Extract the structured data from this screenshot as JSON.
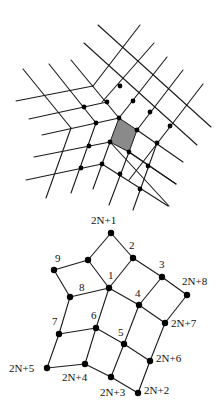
{
  "figure": {
    "top": {
      "title": "Lattice with a five-fold defect (quasi-square net around pentagonal vertex)",
      "shaded_cell_color": "#8a8a8a",
      "line_color": "#1a1a1a",
      "node_color": "#000000"
    },
    "bottom": {
      "labels": {
        "n2N1": "2N+1",
        "n2": "2",
        "n3": "3",
        "n2N8": "2N+8",
        "n9": "9",
        "n1": "1",
        "n8": "8",
        "n4": "4",
        "n7": "7",
        "n6": "6",
        "n2N7": "2N+7",
        "n5": "5",
        "n2N6": "2N+6",
        "n2N5": "2N+5",
        "n2N4": "2N+4",
        "n2N3": "2N+3",
        "n2N2": "2N+2"
      },
      "nodes": [
        {
          "id": "2N+1",
          "x": 111,
          "y": 233
        },
        {
          "id": "a",
          "x": 88,
          "y": 260
        },
        {
          "id": "2",
          "x": 133,
          "y": 258
        },
        {
          "id": "9",
          "x": 54,
          "y": 270
        },
        {
          "id": "3",
          "x": 162,
          "y": 277
        },
        {
          "id": "1",
          "x": 109,
          "y": 288
        },
        {
          "id": "2N+8",
          "x": 187,
          "y": 295
        },
        {
          "id": "8",
          "x": 70,
          "y": 297
        },
        {
          "id": "4",
          "x": 139,
          "y": 305
        },
        {
          "id": "7",
          "x": 59,
          "y": 334
        },
        {
          "id": "6",
          "x": 96,
          "y": 328
        },
        {
          "id": "2N+7",
          "x": 165,
          "y": 323
        },
        {
          "id": "5",
          "x": 124,
          "y": 344
        },
        {
          "id": "2N+6",
          "x": 150,
          "y": 361
        },
        {
          "id": "2N+5",
          "x": 47,
          "y": 368
        },
        {
          "id": "2N+4",
          "x": 85,
          "y": 364
        },
        {
          "id": "2N+3",
          "x": 111,
          "y": 377
        },
        {
          "id": "2N+2",
          "x": 138,
          "y": 393
        }
      ],
      "edges": [
        [
          "2N+1",
          "a"
        ],
        [
          "2N+1",
          "2"
        ],
        [
          "a",
          "9"
        ],
        [
          "a",
          "1"
        ],
        [
          "2",
          "1"
        ],
        [
          "2",
          "3"
        ],
        [
          "3",
          "2N+8"
        ],
        [
          "3",
          "4"
        ],
        [
          "9",
          "8"
        ],
        [
          "8",
          "1"
        ],
        [
          "1",
          "4"
        ],
        [
          "1",
          "6"
        ],
        [
          "2N+8",
          "2N+7"
        ],
        [
          "4",
          "2N+7"
        ],
        [
          "4",
          "5"
        ],
        [
          "8",
          "7"
        ],
        [
          "7",
          "6"
        ],
        [
          "6",
          "5"
        ],
        [
          "6",
          "2N+4"
        ],
        [
          "7",
          "2N+5"
        ],
        [
          "5",
          "2N+6"
        ],
        [
          "5",
          "2N+3"
        ],
        [
          "2N+7",
          "2N+6"
        ],
        [
          "2N+5",
          "2N+4"
        ],
        [
          "2N+4",
          "2N+3"
        ],
        [
          "2N+3",
          "2N+2"
        ],
        [
          "2N+6",
          "2N+2"
        ]
      ]
    }
  }
}
